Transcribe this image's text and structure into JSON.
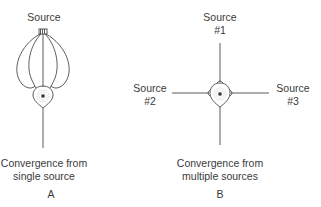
{
  "panel_a": {
    "source_label": "Source",
    "caption_line1": "Convergence from",
    "caption_line2": "single source",
    "letter": "A"
  },
  "panel_b": {
    "source1_line1": "Source",
    "source1_line2": "#1",
    "source2_line1": "Source",
    "source2_line2": "#2",
    "source3_line1": "Source",
    "source3_line2": "#3",
    "caption_line1": "Convergence from",
    "caption_line2": "multiple sources",
    "letter": "B"
  },
  "colors": {
    "line": "#4a4a4a",
    "text": "#3a3a3a",
    "background": "#ffffff"
  }
}
